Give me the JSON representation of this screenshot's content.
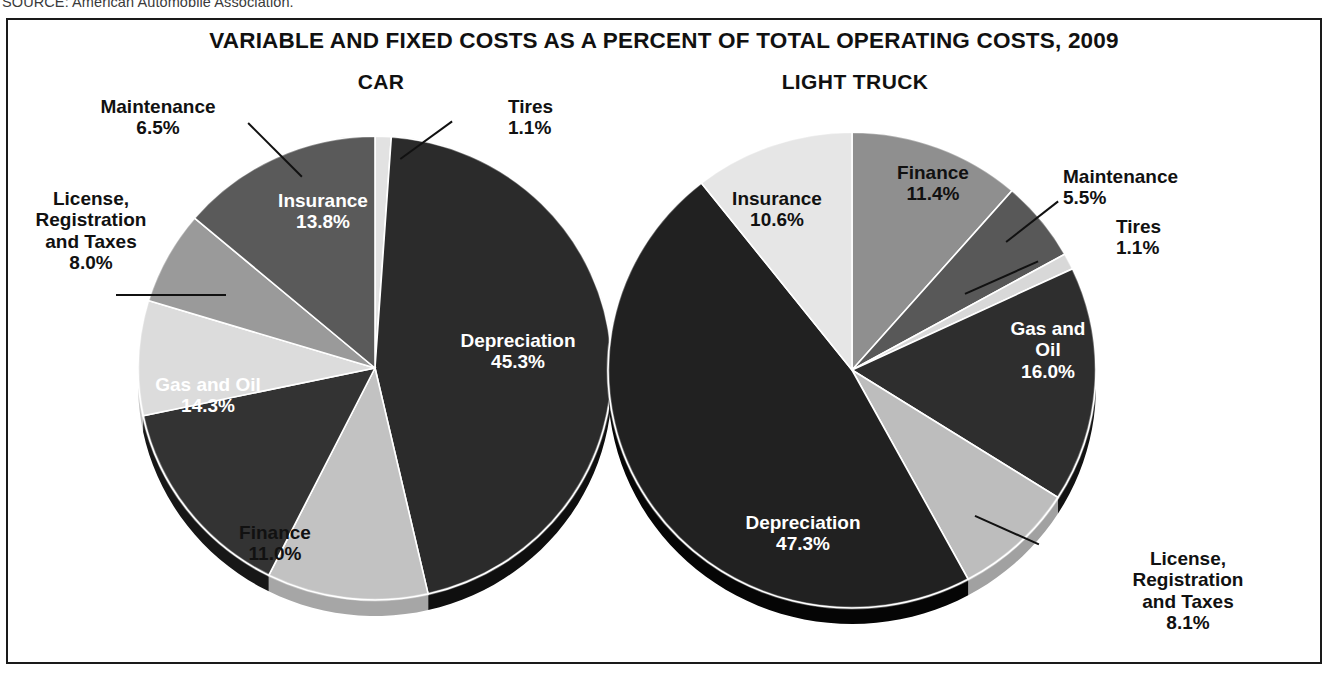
{
  "source_note": "SOURCE: American Automobile Association.",
  "chart_data": {
    "type": "pie",
    "title": "VARIABLE AND FIXED COSTS AS A PERCENT OF TOTAL OPERATING COSTS, 2009",
    "unit": "percent of total operating costs",
    "year": "2009",
    "panels": [
      {
        "name": "car",
        "title": "CAR",
        "categories": [
          "Tires",
          "Depreciation",
          "Finance",
          "Gas and Oil",
          "License, Registration and Taxes",
          "Maintenance",
          "Insurance"
        ],
        "values": [
          1.1,
          45.3,
          11.0,
          14.3,
          8.0,
          6.5,
          13.8
        ],
        "slices": [
          {
            "label": "Tires",
            "value": "1.1%",
            "value_num": 1.1,
            "color": "#e2e2e2",
            "label_style": "callout"
          },
          {
            "label": "Depreciation",
            "value": "45.3%",
            "value_num": 45.3,
            "color": "#2b2b2b",
            "label_style": "inner-dark"
          },
          {
            "label": "Finance",
            "value": "11.0%",
            "value_num": 11.0,
            "color": "#c2c2c2",
            "label_style": "inner-light"
          },
          {
            "label": "Gas and Oil",
            "value": "14.3%",
            "value_num": 14.3,
            "color": "#333333",
            "label_style": "inner-dark"
          },
          {
            "label": "License, Registration and Taxes",
            "value": "8.0%",
            "value_num": 8.0,
            "color": "#dcdcdc",
            "label_style": "callout"
          },
          {
            "label": "Maintenance",
            "value": "6.5%",
            "value_num": 6.5,
            "color": "#9a9a9a",
            "label_style": "callout"
          },
          {
            "label": "Insurance",
            "value": "13.8%",
            "value_num": 13.8,
            "color": "#5a5a5a",
            "label_style": "inner-dark"
          }
        ]
      },
      {
        "name": "light_truck",
        "title": "LIGHT TRUCK",
        "categories": [
          "Finance",
          "Maintenance",
          "Tires",
          "Gas and Oil",
          "License, Registration and Taxes",
          "Depreciation",
          "Insurance"
        ],
        "values": [
          11.4,
          5.5,
          1.1,
          16.0,
          8.1,
          47.3,
          10.6
        ],
        "slices": [
          {
            "label": "Finance",
            "value": "11.4%",
            "value_num": 11.4,
            "color": "#8f8f8f",
            "label_style": "inner-light"
          },
          {
            "label": "Maintenance",
            "value": "5.5%",
            "value_num": 5.5,
            "color": "#585858",
            "label_style": "callout"
          },
          {
            "label": "Tires",
            "value": "1.1%",
            "value_num": 1.1,
            "color": "#d8d8d8",
            "label_style": "callout"
          },
          {
            "label": "Gas and Oil",
            "value": "16.0%",
            "value_num": 16.0,
            "color": "#2e2e2e",
            "label_style": "inner-dark"
          },
          {
            "label": "License, Registration and Taxes",
            "value": "8.1%",
            "value_num": 8.1,
            "color": "#bdbdbd",
            "label_style": "callout"
          },
          {
            "label": "Depreciation",
            "value": "47.3%",
            "value_num": 47.3,
            "color": "#212121",
            "label_style": "inner-dark"
          },
          {
            "label": "Insurance",
            "value": "10.6%",
            "value_num": 10.6,
            "color": "#e6e6e6",
            "label_style": "inner-light"
          }
        ]
      }
    ]
  },
  "car": {
    "title": "CAR",
    "maintenance_label": "Maintenance\n6.5%",
    "tires_label": "Tires\n1.1%",
    "license_label": "License,\nRegistration\nand Taxes\n8.0%",
    "insurance_label": "Insurance\n13.8%",
    "depreciation_label": "Depreciation\n45.3%",
    "gas_label": "Gas and Oil\n14.3%",
    "finance_label": "Finance\n11.0%"
  },
  "truck": {
    "title": "LIGHT TRUCK",
    "insurance_label": "Insurance\n10.6%",
    "finance_label": "Finance\n11.4%",
    "maintenance_label": "Maintenance\n5.5%",
    "tires_label": "Tires\n1.1%",
    "gas_label": "Gas and\nOil\n16.0%",
    "depreciation_label": "Depreciation\n47.3%",
    "license_label": "License,\nRegistration\nand Taxes\n8.1%"
  }
}
